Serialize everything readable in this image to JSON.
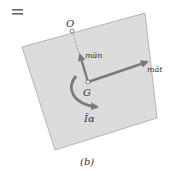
{
  "figure": {
    "equals_sign": "=",
    "caption": "(b)",
    "labels": {
      "point_O": "O",
      "point_G": "G",
      "normal_force": "ma̅n",
      "tangential_force": "ma̅t",
      "moment": "Īα"
    },
    "colors": {
      "body_fill": "#dcdcdc",
      "body_stroke": "#b5b5b5",
      "arrow": "#7a7a7a",
      "text": "#333333"
    }
  }
}
